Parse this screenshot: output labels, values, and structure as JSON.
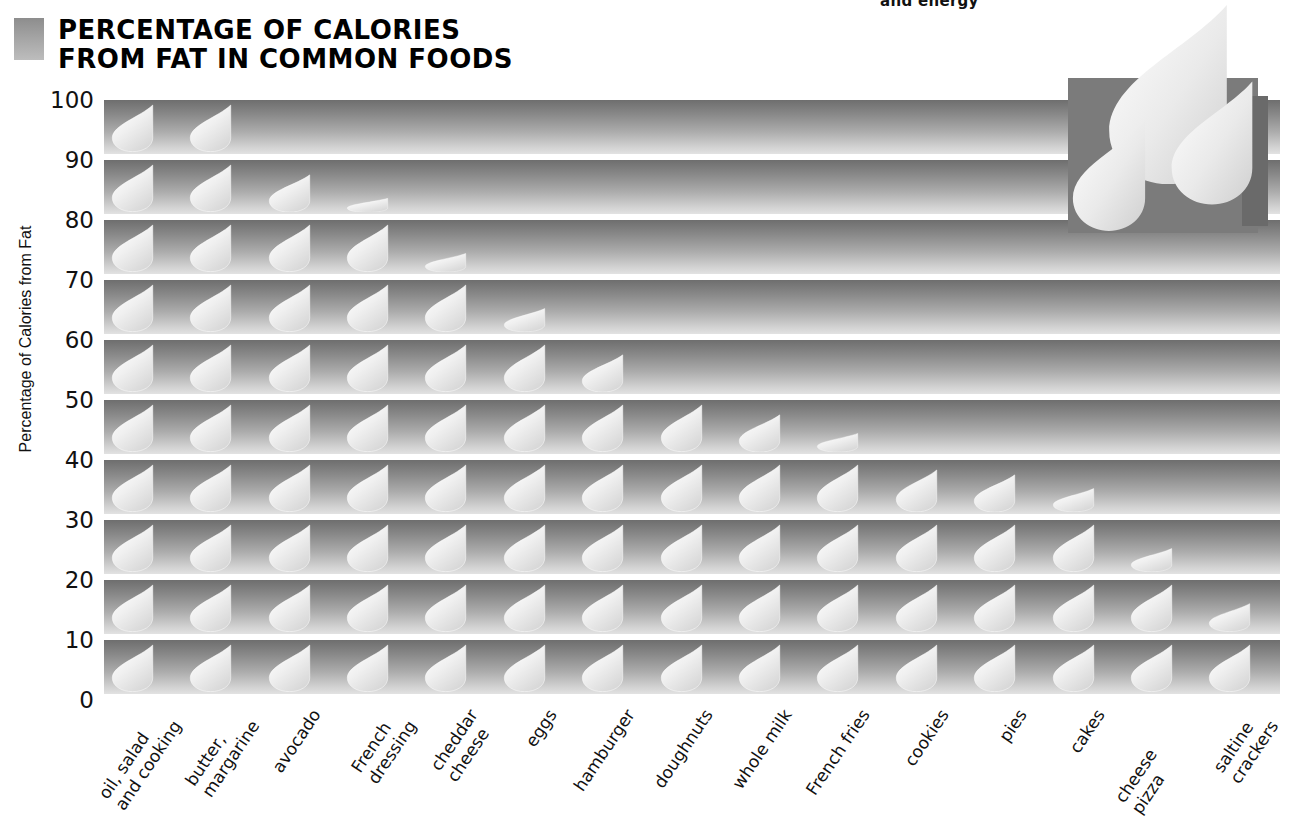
{
  "header": {
    "title": "PERCENTAGE OF CALORIES\nFROM FAT IN COMMON FOODS",
    "top_bleed_text": "and energy",
    "swatch_color": "#a8a8a8"
  },
  "colors": {
    "band_dark": "#6e6e6e",
    "band_light": "#e2e2e2",
    "droplet": "#e8e8e8",
    "deco_box": "#7b7b7b",
    "text": "#111111"
  },
  "icons": {
    "droplet": "droplet-icon",
    "decorative_droplet": "decorative-droplet-icon"
  },
  "chart_data": {
    "type": "bar",
    "title": "PERCENTAGE OF CALORIES FROM FAT IN COMMON FOODS",
    "xlabel": "",
    "ylabel": "Percentage of Calories from Fat",
    "ylim": [
      0,
      100
    ],
    "ytick_values": [
      0,
      10,
      20,
      30,
      40,
      50,
      60,
      70,
      80,
      90,
      100
    ],
    "ytick_labels": [
      "0",
      "10",
      "20",
      "30",
      "40",
      "50",
      "60",
      "70",
      "80",
      "90",
      "100"
    ],
    "grid": false,
    "legend": "none",
    "band_size": 10,
    "orientation": "vertical-pictogram",
    "unit_symbol": "droplet",
    "categories": [
      "oil, salad\nand cooking",
      "butter,\nmargarine",
      "avocado",
      "French\ndressing",
      "cheddar\ncheese",
      "eggs",
      "hamburger",
      "doughnuts",
      "whole milk",
      "French fries",
      "cookies",
      "pies",
      "cakes",
      "cheese pizza",
      "saltine\ncrackers"
    ],
    "values": [
      100,
      100,
      88,
      83,
      74,
      65,
      58,
      50,
      48,
      44,
      39,
      38,
      35,
      25,
      16
    ]
  }
}
